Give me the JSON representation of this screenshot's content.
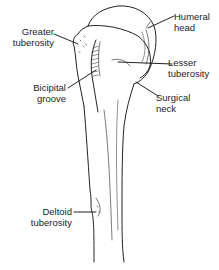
{
  "diagram": {
    "colors": {
      "line": "#222222",
      "background": "#ffffff"
    },
    "labels": [
      {
        "id": "greater-tuberosity",
        "line1": "Greater",
        "line2": "tuberosity"
      },
      {
        "id": "humeral-head",
        "line1": "Humeral",
        "line2": "head"
      },
      {
        "id": "lesser-tuberosity",
        "line1": "Lesser",
        "line2": "tuberosity"
      },
      {
        "id": "bicipital-groove",
        "line1": "Bicipital",
        "line2": "groove"
      },
      {
        "id": "surgical-neck",
        "line1": "Surgical",
        "line2": "neck"
      },
      {
        "id": "deltoid-tuberosity",
        "line1": "Deltoid",
        "line2": "tuberosity"
      }
    ]
  }
}
